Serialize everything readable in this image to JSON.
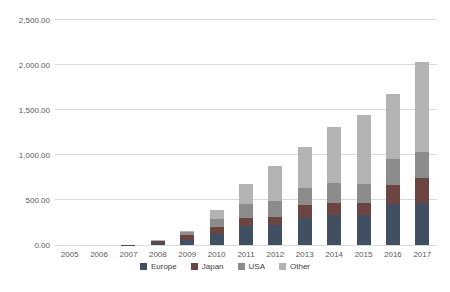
{
  "chart_data": {
    "type": "bar",
    "stacked": true,
    "title": "",
    "xlabel": "",
    "ylabel": "",
    "ylim": [
      0,
      2500
    ],
    "ytick_step": 500,
    "ytick_labels": [
      "0.00",
      "500.00",
      "1,000.00",
      "1,500.00",
      "2,000.00",
      "2,500.00"
    ],
    "grid": true,
    "legend_position": "bottom",
    "categories": [
      "2005",
      "2006",
      "2007",
      "2008",
      "2009",
      "2010",
      "2011",
      "2012",
      "2013",
      "2014",
      "2015",
      "2016",
      "2017"
    ],
    "series": [
      {
        "name": "Europe",
        "color": "#414f63",
        "values": [
          0,
          0,
          2,
          25,
          60,
          125,
          215,
          225,
          300,
          335,
          330,
          455,
          465
        ]
      },
      {
        "name": "Japan",
        "color": "#6c4441",
        "values": [
          0,
          0,
          1,
          20,
          55,
          75,
          80,
          85,
          145,
          135,
          135,
          210,
          280
        ]
      },
      {
        "name": "USA",
        "color": "#8c8c8c",
        "values": [
          0,
          0,
          1,
          5,
          25,
          90,
          165,
          180,
          190,
          220,
          210,
          295,
          285
        ]
      },
      {
        "name": "Other",
        "color": "#b3b3b3",
        "values": [
          0,
          0,
          1,
          5,
          20,
          100,
          220,
          390,
          455,
          620,
          775,
          715,
          1005
        ]
      }
    ],
    "totals": [
      0,
      0,
      5,
      55,
      160,
      390,
      680,
      880,
      1090,
      1310,
      1450,
      1675,
      2035
    ]
  },
  "style": {
    "gridline_color": "#d9d9d9",
    "tick_label_color": "#595959",
    "legend_label_color": "#404040",
    "background_color": "#ffffff"
  }
}
